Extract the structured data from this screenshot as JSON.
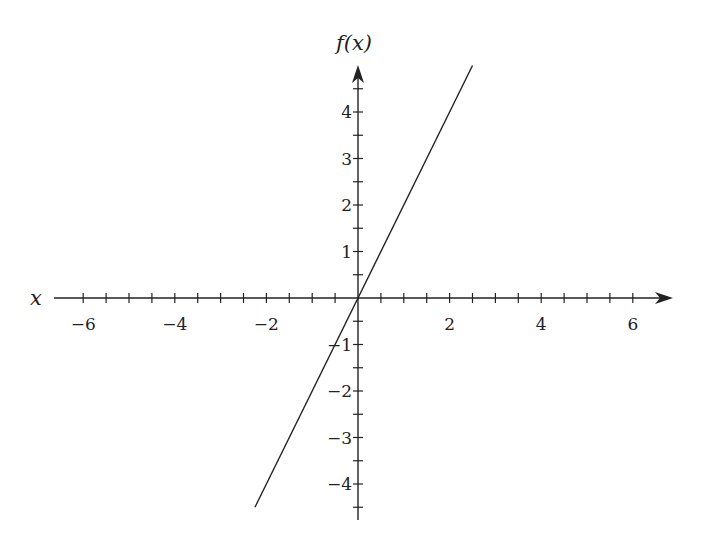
{
  "chart_data": {
    "type": "line",
    "title": "",
    "xlabel": "x",
    "ylabel": "f(x)",
    "function": "f(x) = 2x",
    "series": [
      {
        "name": "f(x)",
        "x": [
          -2.25,
          2.5
        ],
        "y": [
          -4.5,
          5.0
        ]
      }
    ],
    "xlim": [
      -6.6,
      6.9
    ],
    "ylim": [
      -4.8,
      5.0
    ],
    "x_ticks_major": [
      -6,
      -4,
      -2,
      2,
      4,
      6
    ],
    "x_tick_labels": [
      "−6",
      "−4",
      "−2",
      "2",
      "4",
      "6"
    ],
    "x_minor_step": 0.5,
    "y_ticks_major": [
      -4,
      -3,
      -2,
      -1,
      1,
      2,
      3,
      4
    ],
    "y_tick_labels": [
      "−4",
      "−3",
      "−2",
      "−1",
      "1",
      "2",
      "3",
      "4"
    ],
    "y_minor_step": 0.5,
    "grid": false,
    "legend": null
  },
  "geometry": {
    "origin_x": 358,
    "origin_y": 298,
    "px_per_unit_x": 45.8,
    "px_per_unit_y": 46.5,
    "x_axis_start": 54,
    "x_axis_end": 673,
    "y_axis_top": 65,
    "y_axis_bottom": 520
  },
  "colors": {
    "axis": "#222222",
    "line": "#222222"
  }
}
